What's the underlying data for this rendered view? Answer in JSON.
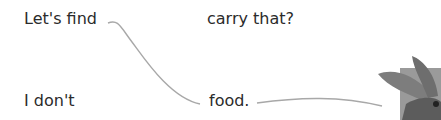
{
  "exercise": {
    "left_column": [
      {
        "text": "Let's find"
      },
      {
        "text": "I don't"
      }
    ],
    "right_column": [
      {
        "text": "carry that?"
      },
      {
        "text": "food."
      }
    ],
    "connections": [
      {
        "from": "Let's find",
        "to": "food."
      },
      {
        "from": "food.",
        "to": "picture"
      }
    ],
    "line_color": "#a8a8a8",
    "picture": {
      "subject": "rabbit-ears-illustration"
    }
  }
}
